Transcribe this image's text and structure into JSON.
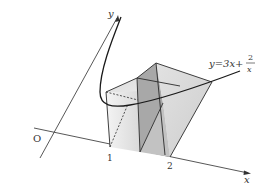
{
  "diagram": {
    "axes": {
      "x_label": "x",
      "y_label": "y",
      "origin_label": "O"
    },
    "ticks": [
      {
        "label": "1"
      },
      {
        "label": "2"
      }
    ],
    "curve": {
      "equation_lhs": "y=3x+",
      "fraction_numerator": "2",
      "fraction_denominator": "x"
    },
    "colors": {
      "line": "#2a2a2a",
      "face_light": "#e6e6e6",
      "face_mid": "#cfcfcf",
      "face_dark": "#a9a9a9",
      "face_top": "#dcdcdc"
    }
  }
}
